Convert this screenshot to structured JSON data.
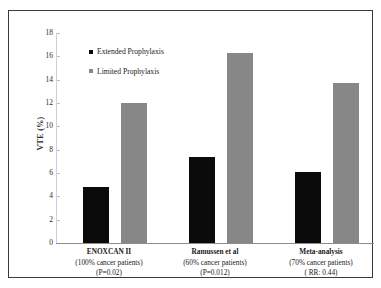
{
  "chart_data": {
    "type": "bar",
    "title": "",
    "xlabel": "",
    "ylabel": "VTE (%)",
    "ylim": [
      0,
      18
    ],
    "yticks": [
      18,
      16,
      14,
      12,
      10,
      8,
      6,
      4,
      2,
      0
    ],
    "grid": false,
    "legend_position": "upper-left-inside",
    "categories": [
      "ENOXCAN II",
      "Ramussen et al",
      "Meta-analysis"
    ],
    "category_notes": [
      [
        "(100% cancer patients)",
        "(P=0.02)"
      ],
      [
        "(60% cancer patients)",
        "(P=0.012)"
      ],
      [
        "(70% cancer patients)",
        "( RR: 0.44)"
      ]
    ],
    "series": [
      {
        "name": "Extended Prophylaxis",
        "color": "#0b0b0b",
        "values": [
          4.8,
          7.4,
          6.1
        ]
      },
      {
        "name": "Limited Prophylaxis",
        "color": "#878787",
        "values": [
          12.0,
          16.3,
          13.7
        ]
      }
    ]
  },
  "legend": {
    "items": [
      {
        "label": "Extended Prophylaxis"
      },
      {
        "label": "Limited Prophylaxis"
      }
    ]
  },
  "axis": {
    "y_title": "VTE (%)",
    "ticks": [
      "18",
      "16",
      "14",
      "12",
      "10",
      "8",
      "6",
      "4",
      "2",
      "0"
    ]
  },
  "categories": [
    {
      "name": "ENOXCAN II",
      "line2": "(100% cancer patients)",
      "line3": "(P=0.02)"
    },
    {
      "name": "Ramussen et al",
      "line2": "(60% cancer patients)",
      "line3": "(P=0.012)"
    },
    {
      "name": "Meta-analysis",
      "line2": "(70% cancer patients)",
      "line3": "( RR: 0.44)"
    }
  ]
}
